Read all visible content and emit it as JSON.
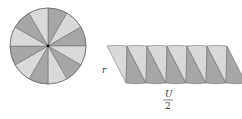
{
  "diagram": {
    "circle": {
      "cx": 48,
      "cy": 46,
      "r": 38,
      "sectors": 12
    },
    "colors": {
      "light": "#d9d9d9",
      "dark": "#a6a6a6",
      "stroke": "#666666",
      "center": "#111111"
    },
    "strip": {
      "x0": 107,
      "y_top": 46,
      "y_bottom": 83,
      "shift": 9,
      "wedge_width": 20,
      "count": 6
    },
    "labels": {
      "radius": "r",
      "half_circumference_numerator": "U",
      "half_circumference_denominator": "2"
    }
  }
}
